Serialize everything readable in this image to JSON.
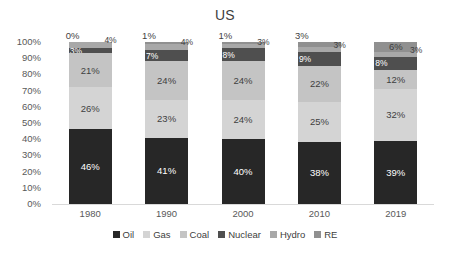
{
  "chart_data": {
    "type": "bar",
    "stacked": true,
    "normalized_percent": true,
    "title": "US",
    "subtitle": "",
    "xlabel": "",
    "ylabel": "",
    "categories": [
      "1980",
      "1990",
      "2000",
      "2010",
      "2019"
    ],
    "ylim": [
      0,
      100
    ],
    "ytick_labels": [
      "100%",
      "90%",
      "80%",
      "70%",
      "60%",
      "50%",
      "40%",
      "30%",
      "20%",
      "10%",
      "0%"
    ],
    "ytick_values": [
      100,
      90,
      80,
      70,
      60,
      50,
      40,
      30,
      20,
      10,
      0
    ],
    "grid": false,
    "legend_position": "bottom",
    "series": [
      {
        "name": "Oil",
        "color": "#272727",
        "values": [
          46,
          41,
          40,
          38,
          39
        ],
        "labels": [
          "46%",
          "41%",
          "40%",
          "38%",
          "39%"
        ]
      },
      {
        "name": "Gas",
        "color": "#d4d4d4",
        "values": [
          26,
          23,
          24,
          25,
          32
        ],
        "labels": [
          "26%",
          "23%",
          "24%",
          "25%",
          "32%"
        ]
      },
      {
        "name": "Coal",
        "color": "#c4c4c4",
        "values": [
          21,
          24,
          24,
          22,
          12
        ],
        "labels": [
          "21%",
          "24%",
          "24%",
          "22%",
          "12%"
        ]
      },
      {
        "name": "Nuclear",
        "color": "#4f4f4f",
        "values": [
          3,
          7,
          8,
          9,
          8
        ],
        "labels": [
          "3%",
          "7%",
          "8%",
          "9%",
          "8%"
        ]
      },
      {
        "name": "Hydro",
        "color": "#a8a8a8",
        "values": [
          4,
          4,
          3,
          3,
          3
        ],
        "labels": [
          "4%",
          "4%",
          "3%",
          "3%",
          "3%"
        ]
      },
      {
        "name": "RE",
        "color": "#909090",
        "values": [
          0,
          1,
          1,
          3,
          6
        ],
        "labels": [
          "0%",
          "1%",
          "1%",
          "3%",
          "6%"
        ]
      }
    ]
  },
  "axis": {
    "y_ticks": [
      {
        "label": "100%"
      },
      {
        "label": "90%"
      },
      {
        "label": "80%"
      },
      {
        "label": "70%"
      },
      {
        "label": "60%"
      },
      {
        "label": "50%"
      },
      {
        "label": "40%"
      },
      {
        "label": "30%"
      },
      {
        "label": "20%"
      },
      {
        "label": "10%"
      },
      {
        "label": "0%"
      }
    ],
    "x_ticks": [
      {
        "label": "1980"
      },
      {
        "label": "1990"
      },
      {
        "label": "2000"
      },
      {
        "label": "2010"
      },
      {
        "label": "2019"
      }
    ]
  },
  "legend": {
    "items": [
      {
        "label": "Oil",
        "color": "#272727"
      },
      {
        "label": "Gas",
        "color": "#d4d4d4"
      },
      {
        "label": "Coal",
        "color": "#c4c4c4"
      },
      {
        "label": "Nuclear",
        "color": "#4f4f4f"
      },
      {
        "label": "Hydro",
        "color": "#a8a8a8"
      },
      {
        "label": "RE",
        "color": "#909090"
      }
    ]
  },
  "bars": [
    {
      "category": "1980",
      "segments": [
        {
          "series": "RE",
          "label": "0%",
          "value": 0,
          "color": "#909090",
          "label_style": "callout-left",
          "text": "dark"
        },
        {
          "series": "Hydro",
          "label": "4%",
          "value": 4,
          "color": "#a8a8a8",
          "label_style": "callout-right",
          "text": "dark"
        },
        {
          "series": "Nuclear",
          "label": "3%",
          "value": 3,
          "color": "#4f4f4f",
          "label_style": "inside-tiny",
          "text": "light"
        },
        {
          "series": "Coal",
          "label": "21%",
          "value": 21,
          "color": "#c4c4c4",
          "label_style": "inside",
          "text": "dark"
        },
        {
          "series": "Gas",
          "label": "26%",
          "value": 26,
          "color": "#d4d4d4",
          "label_style": "inside",
          "text": "dark"
        },
        {
          "series": "Oil",
          "label": "46%",
          "value": 46,
          "color": "#272727",
          "label_style": "inside",
          "text": "light"
        }
      ]
    },
    {
      "category": "1990",
      "segments": [
        {
          "series": "RE",
          "label": "1%",
          "value": 1,
          "color": "#909090",
          "label_style": "callout-left",
          "text": "dark"
        },
        {
          "series": "Hydro",
          "label": "4%",
          "value": 4,
          "color": "#a8a8a8",
          "label_style": "callout-right",
          "text": "dark"
        },
        {
          "series": "Nuclear",
          "label": "7%",
          "value": 7,
          "color": "#4f4f4f",
          "label_style": "inside-tiny",
          "text": "light"
        },
        {
          "series": "Coal",
          "label": "24%",
          "value": 24,
          "color": "#c4c4c4",
          "label_style": "inside",
          "text": "dark"
        },
        {
          "series": "Gas",
          "label": "23%",
          "value": 23,
          "color": "#d4d4d4",
          "label_style": "inside",
          "text": "dark"
        },
        {
          "series": "Oil",
          "label": "41%",
          "value": 41,
          "color": "#272727",
          "label_style": "inside",
          "text": "light"
        }
      ]
    },
    {
      "category": "2000",
      "segments": [
        {
          "series": "RE",
          "label": "1%",
          "value": 1,
          "color": "#909090",
          "label_style": "callout-left",
          "text": "dark"
        },
        {
          "series": "Hydro",
          "label": "3%",
          "value": 3,
          "color": "#a8a8a8",
          "label_style": "callout-right",
          "text": "dark"
        },
        {
          "series": "Nuclear",
          "label": "8%",
          "value": 8,
          "color": "#4f4f4f",
          "label_style": "inside-tiny",
          "text": "light"
        },
        {
          "series": "Coal",
          "label": "24%",
          "value": 24,
          "color": "#c4c4c4",
          "label_style": "inside",
          "text": "dark"
        },
        {
          "series": "Gas",
          "label": "24%",
          "value": 24,
          "color": "#d4d4d4",
          "label_style": "inside",
          "text": "dark"
        },
        {
          "series": "Oil",
          "label": "40%",
          "value": 40,
          "color": "#272727",
          "label_style": "inside",
          "text": "light"
        }
      ]
    },
    {
      "category": "2010",
      "segments": [
        {
          "series": "RE",
          "label": "3%",
          "value": 3,
          "color": "#909090",
          "label_style": "callout-left",
          "text": "dark"
        },
        {
          "series": "Hydro",
          "label": "3%",
          "value": 3,
          "color": "#a8a8a8",
          "label_style": "callout-right",
          "text": "dark"
        },
        {
          "series": "Nuclear",
          "label": "9%",
          "value": 9,
          "color": "#4f4f4f",
          "label_style": "inside-tiny",
          "text": "light"
        },
        {
          "series": "Coal",
          "label": "22%",
          "value": 22,
          "color": "#c4c4c4",
          "label_style": "inside",
          "text": "dark"
        },
        {
          "series": "Gas",
          "label": "25%",
          "value": 25,
          "color": "#d4d4d4",
          "label_style": "inside",
          "text": "dark"
        },
        {
          "series": "Oil",
          "label": "38%",
          "value": 38,
          "color": "#272727",
          "label_style": "inside",
          "text": "light"
        }
      ]
    },
    {
      "category": "2019",
      "segments": [
        {
          "series": "RE",
          "label": "6%",
          "value": 6,
          "color": "#909090",
          "label_style": "inside",
          "text": "dark"
        },
        {
          "series": "Hydro",
          "label": "3%",
          "value": 3,
          "color": "#a8a8a8",
          "label_style": "callout-right",
          "text": "dark"
        },
        {
          "series": "Nuclear",
          "label": "8%",
          "value": 8,
          "color": "#4f4f4f",
          "label_style": "inside-tiny",
          "text": "light"
        },
        {
          "series": "Coal",
          "label": "12%",
          "value": 12,
          "color": "#c4c4c4",
          "label_style": "inside",
          "text": "dark"
        },
        {
          "series": "Gas",
          "label": "32%",
          "value": 32,
          "color": "#d4d4d4",
          "label_style": "inside",
          "text": "dark"
        },
        {
          "series": "Oil",
          "label": "39%",
          "value": 39,
          "color": "#272727",
          "label_style": "inside",
          "text": "light"
        }
      ]
    }
  ]
}
